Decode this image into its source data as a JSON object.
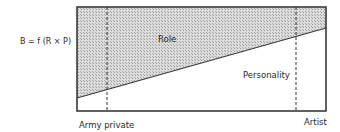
{
  "formula": "B = f (R × P)",
  "regions": {
    "role": "Role",
    "personality": "Personality"
  },
  "axis_labels": {
    "left": "Army private",
    "right": "Artist"
  },
  "colors": {
    "frame": "#3a3a3a",
    "hatch_bg": "#d8d8d8",
    "hatch_dot": "#9a9a9a",
    "background": "#ffffff"
  }
}
